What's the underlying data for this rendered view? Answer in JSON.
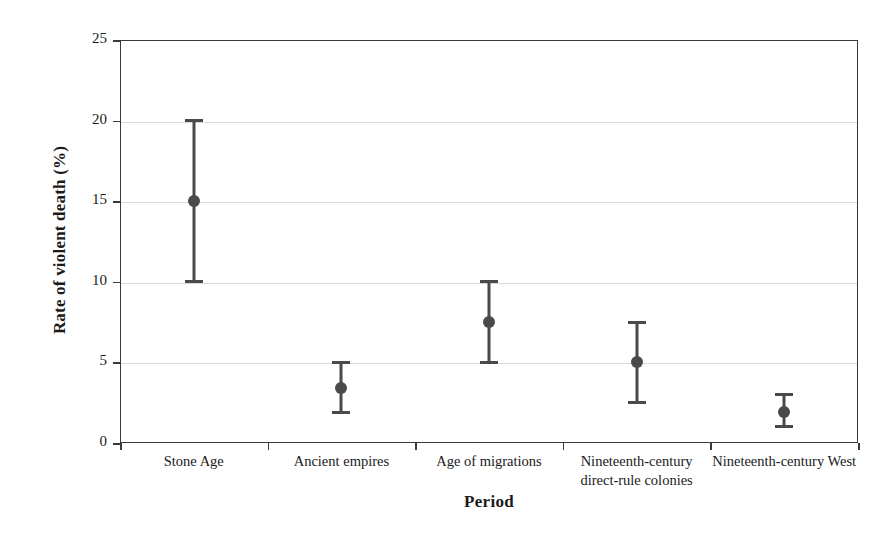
{
  "chart_data": {
    "type": "scatter",
    "title": "",
    "xlabel": "Period",
    "ylabel": "Rate of violent death (%)",
    "categories": [
      "Stone Age",
      "Ancient empires",
      "Age of migrations",
      "Nineteenth-century direct-rule colonies",
      "Nineteenth-century West"
    ],
    "values": [
      15.0,
      3.4,
      7.5,
      5.0,
      1.9
    ],
    "error_low": [
      10.0,
      1.9,
      5.0,
      2.5,
      1.0
    ],
    "error_high": [
      20.0,
      5.0,
      10.0,
      7.5,
      3.0
    ],
    "ylim": [
      0,
      25
    ],
    "yticks": [
      0,
      5,
      10,
      15,
      20,
      25
    ],
    "ytick_labels": [
      "0",
      "5",
      "10",
      "15",
      "20",
      "25"
    ],
    "grid": true,
    "legend": "none",
    "marker_color": "#4a4a4a",
    "errorbar_color": "#4a4a4a",
    "grid_color": "#d8d8d8",
    "axis_color": "#3a3a3a",
    "background": "#ffffff"
  }
}
